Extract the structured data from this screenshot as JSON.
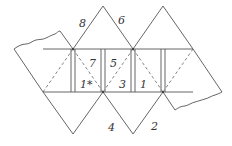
{
  "figure": {
    "type": "folding net diagram (triangular faces with strips and fold lines)",
    "labels": {
      "top_left_triangle": "8",
      "top_right_triangle": "6",
      "strip_7": "7",
      "strip_5": "5",
      "strip_1_star": "1*",
      "strip_3": "3",
      "strip_1": "1",
      "bottom_left_triangle": "4",
      "bottom_right_triangle": "2"
    },
    "line_styles": {
      "edge": "solid",
      "fold": "dashed",
      "torn_edge": "wavy"
    },
    "colors": {
      "stroke": "#555555",
      "text": "#333333",
      "background": "#ffffff"
    }
  }
}
